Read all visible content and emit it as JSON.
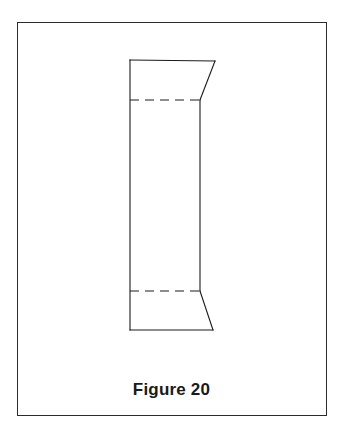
{
  "figure": {
    "caption": "Figure 20",
    "frame": {
      "x": 17,
      "y": 22,
      "width": 310,
      "height": 394,
      "stroke_color": "#2b2b2b",
      "stroke_width": 1.5,
      "background": "#ffffff"
    },
    "drawing": {
      "description": "Line drawing of an open rectangular tube / box shell seen in perspective, hidden interior edges drawn as dashed lines",
      "stroke_color": "#1c1c1c",
      "solid_stroke_width": 1.1,
      "hidden_stroke_width": 1.1,
      "hidden_dash_pattern": "9,6",
      "solid_edges": [
        {
          "name": "top-front-edge",
          "x1": 130,
          "y1": 60,
          "x2": 215,
          "y2": 61
        },
        {
          "name": "top-right-diagonal",
          "x1": 215,
          "y1": 61,
          "x2": 200,
          "y2": 100
        },
        {
          "name": "left-vertical-edge",
          "x1": 130,
          "y1": 60,
          "x2": 130,
          "y2": 330
        },
        {
          "name": "right-vertical-edge",
          "x1": 200,
          "y1": 100,
          "x2": 200,
          "y2": 291
        },
        {
          "name": "bottom-right-diagonal",
          "x1": 200,
          "y1": 291,
          "x2": 213,
          "y2": 330
        },
        {
          "name": "bottom-front-edge",
          "x1": 130,
          "y1": 330,
          "x2": 213,
          "y2": 330
        }
      ],
      "hidden_edges": [
        {
          "name": "upper-hidden-edge",
          "x1": 130,
          "y1": 100,
          "x2": 200,
          "y2": 100
        },
        {
          "name": "lower-hidden-edge",
          "x1": 130,
          "y1": 291,
          "x2": 200,
          "y2": 291
        }
      ]
    }
  },
  "colors": {
    "page_background": "#ffffff",
    "ink": "#1c1c1c",
    "frame": "#2b2b2b",
    "caption": "#1a1a1a"
  }
}
